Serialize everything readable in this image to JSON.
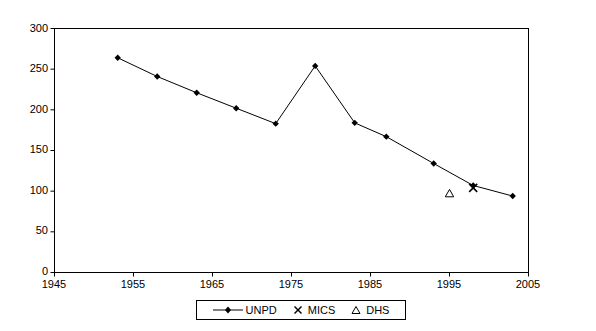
{
  "chart_data": {
    "type": "line",
    "title": "",
    "xlabel": "",
    "ylabel": "",
    "xlim": [
      1945,
      2005
    ],
    "ylim": [
      0,
      300
    ],
    "xticks": [
      1945,
      1955,
      1965,
      1975,
      1985,
      1995,
      2005
    ],
    "yticks": [
      0,
      50,
      100,
      150,
      200,
      250,
      300
    ],
    "grid": false,
    "legend_position": "bottom-center",
    "series": [
      {
        "name": "UNPD",
        "marker": "filled-diamond",
        "line": true,
        "points": [
          {
            "x": 1953,
            "y": 264
          },
          {
            "x": 1958,
            "y": 241
          },
          {
            "x": 1963,
            "y": 221
          },
          {
            "x": 1968,
            "y": 202
          },
          {
            "x": 1973,
            "y": 183
          },
          {
            "x": 1978,
            "y": 254
          },
          {
            "x": 1983,
            "y": 184
          },
          {
            "x": 1987,
            "y": 167
          },
          {
            "x": 1993,
            "y": 134
          },
          {
            "x": 1998,
            "y": 107
          },
          {
            "x": 2003,
            "y": 94
          }
        ]
      },
      {
        "name": "MICS",
        "marker": "x-cross",
        "line": false,
        "points": [
          {
            "x": 1998,
            "y": 104
          }
        ]
      },
      {
        "name": "DHS",
        "marker": "open-triangle",
        "line": false,
        "points": [
          {
            "x": 1995,
            "y": 97
          }
        ]
      }
    ]
  },
  "axis": {
    "y_tick_labels": [
      "300",
      "250",
      "200",
      "150",
      "100",
      "50",
      "0"
    ],
    "x_tick_labels": [
      "1945",
      "1955",
      "1965",
      "1975",
      "1985",
      "1995",
      "2005"
    ]
  },
  "legend": {
    "items": [
      {
        "label": "UNPD",
        "icon": "line-with-diamond-marker"
      },
      {
        "label": "MICS",
        "icon": "x-cross-marker"
      },
      {
        "label": "DHS",
        "icon": "open-triangle-marker"
      }
    ]
  },
  "colors": {
    "axis": "#000000",
    "series": "#000000",
    "background": "#ffffff"
  }
}
